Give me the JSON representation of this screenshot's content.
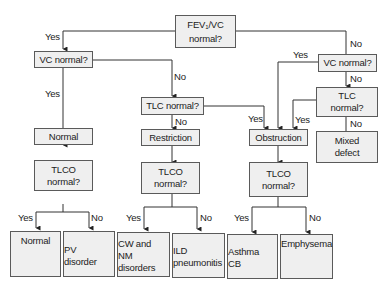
{
  "diagram": {
    "nodes": {
      "fev1_vc": {
        "pre": "FEV",
        "sub": "1",
        "post": "/VC",
        "line2": "normal?"
      },
      "vc_left": "VC normal?",
      "vc_right": "VC normal?",
      "tlc_mid": "TLC normal?",
      "tlc_right": {
        "line1": "TLC",
        "line2": "normal?"
      },
      "normal": "Normal",
      "restriction": "Restriction",
      "obstruction": "Obstruction",
      "mixed": {
        "line1": "Mixed",
        "line2": "defect"
      },
      "tlco_1": {
        "line1": "TLCO",
        "line2": "normal?"
      },
      "tlco_2": {
        "line1": "TLCO",
        "line2": "normal?"
      },
      "tlco_3": {
        "line1": "TLCO",
        "line2": "normal?"
      },
      "out_normal": "Normal",
      "out_pv": {
        "line1": "PV",
        "line2": "disorder"
      },
      "out_cw": {
        "line1": "CW and",
        "line2": "NM",
        "line3": "disorders"
      },
      "out_ild": {
        "line1": "ILD",
        "line2": "pneumonitis"
      },
      "out_asthma": {
        "line1": "Asthma",
        "line2": "CB"
      },
      "out_emphysema": "Emphysema"
    },
    "edge_labels": {
      "yes": "Yes",
      "no": "No"
    }
  }
}
